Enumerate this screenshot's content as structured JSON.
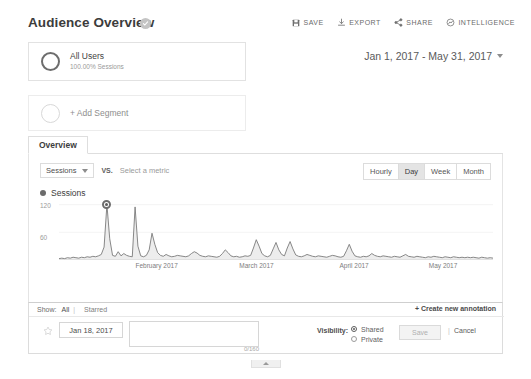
{
  "header": {
    "title": "Audience Overview",
    "verified_icon": "check-badge-icon",
    "toolbar": [
      {
        "label": "SAVE",
        "icon": "floppy-disk-icon"
      },
      {
        "label": "EXPORT",
        "icon": "download-icon"
      },
      {
        "label": "SHARE",
        "icon": "share-icon"
      },
      {
        "label": "INTELLIGENCE",
        "icon": "intelligence-icon"
      }
    ]
  },
  "segments": {
    "all_users": {
      "name": "All Users",
      "detail": "100.00% Sessions"
    },
    "add_segment_label": "+ Add Segment"
  },
  "date_range": {
    "text": "Jan 1, 2017 - May 31, 2017"
  },
  "tabs": [
    {
      "label": "Overview",
      "active": true
    }
  ],
  "controls": {
    "metric_selected": "Sessions",
    "vs_label": "VS.",
    "metric_placeholder": "Select a metric",
    "granularity": [
      {
        "label": "Hourly",
        "active": false
      },
      {
        "label": "Day",
        "active": true
      },
      {
        "label": "Week",
        "active": false
      },
      {
        "label": "Month",
        "active": false
      }
    ]
  },
  "chart_data": {
    "type": "area",
    "title": "Sessions",
    "legend": [
      "Sessions"
    ],
    "legend_position": "top-left",
    "xlabel": "",
    "ylabel": "",
    "ylim": [
      0,
      130
    ],
    "yticks": [
      60,
      120
    ],
    "ytick_labels": [
      "60",
      "120"
    ],
    "grid": false,
    "xtick_labels": [
      "February 2017",
      "March 2017",
      "April 2017",
      "May 2017"
    ],
    "xtick_positions_pct": [
      22.5,
      45.5,
      68.0,
      88.5
    ],
    "series_color": "#7a7a7a",
    "fill_color": "#ededed",
    "highlight_point": {
      "index": 17,
      "value": 120,
      "label": "Jan 18, 2017"
    },
    "values": [
      3,
      4,
      3,
      5,
      4,
      6,
      5,
      4,
      6,
      5,
      7,
      6,
      8,
      7,
      9,
      12,
      28,
      120,
      46,
      10,
      8,
      18,
      9,
      14,
      10,
      8,
      7,
      115,
      30,
      9,
      7,
      10,
      22,
      58,
      34,
      16,
      10,
      8,
      12,
      9,
      7,
      8,
      10,
      9,
      8,
      7,
      9,
      14,
      18,
      15,
      10,
      8,
      7,
      9,
      8,
      7,
      6,
      8,
      14,
      22,
      16,
      9,
      7,
      8,
      6,
      7,
      9,
      8,
      10,
      26,
      44,
      30,
      14,
      9,
      7,
      10,
      24,
      38,
      22,
      12,
      9,
      26,
      40,
      24,
      11,
      8,
      7,
      9,
      12,
      10,
      8,
      7,
      9,
      8,
      7,
      6,
      8,
      10,
      9,
      7,
      6,
      8,
      20,
      34,
      19,
      9,
      7,
      6,
      8,
      7,
      9,
      14,
      10,
      8,
      7,
      9,
      8,
      7,
      6,
      8,
      7,
      6,
      9,
      12,
      8,
      7,
      6,
      8,
      7,
      6,
      5,
      7,
      6,
      8,
      7,
      6,
      5,
      7,
      6,
      5,
      7,
      6,
      5,
      6,
      5,
      6,
      5,
      6,
      5,
      4,
      6,
      5,
      4,
      5,
      4
    ]
  },
  "annotations": {
    "show_label": "Show:",
    "show_all": "All",
    "separator": "|",
    "show_starred": "Starred",
    "create_link": "+ Create new annotation",
    "date_value": "Jan 18, 2017",
    "note_value": "",
    "note_placeholder": "",
    "char_count": "0/160",
    "visibility_label": "Visibility:",
    "visibility_options": [
      {
        "label": "Shared",
        "selected": true
      },
      {
        "label": "Private",
        "selected": false
      }
    ],
    "save_label": "Save",
    "cancel_separator": "|",
    "cancel_label": "Cancel"
  }
}
